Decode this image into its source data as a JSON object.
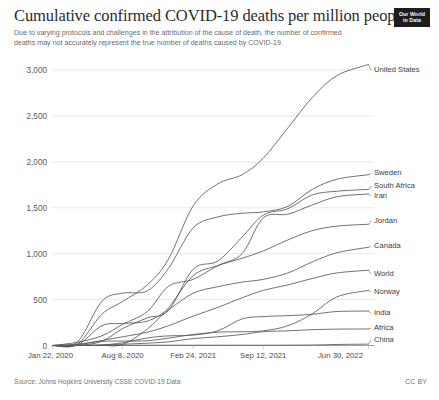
{
  "header": {
    "title": "Cumulative confirmed COVID-19 deaths per million people",
    "subtitle": "Due to varying protocols and challenges in the attribution of the cause of death, the number of confirmed deaths may not accurately represent the true number of deaths caused by COVID-19.",
    "logo_line1": "Our World",
    "logo_line2": "in Data"
  },
  "footer": {
    "source": "Source: Johns Hopkins University CSSE COVID-19 Data",
    "license": "CC BY"
  },
  "colors": {
    "line": "#575757",
    "grid": "#e0e0e0",
    "axis": "#888888",
    "text": "#3c3c3c",
    "logo_bg": "#1d1d1d"
  },
  "chart_data": {
    "type": "line",
    "title": "Cumulative confirmed COVID-19 deaths per million people",
    "subtitle": "Due to varying protocols and challenges in the attribution of the cause of death, the number of confirmed deaths may not accurately represent the true number of deaths caused by COVID-19.",
    "xlabel": "",
    "ylabel": "",
    "ylim": [
      0,
      3000
    ],
    "yticks": [
      0,
      500,
      1000,
      1500,
      2000,
      2500,
      3000
    ],
    "ytick_labels": [
      "0",
      "500",
      "1,000",
      "1,500",
      "2,000",
      "2,500",
      "3,000"
    ],
    "grid": true,
    "legend_position": "right-of-line-ends",
    "x_range": [
      "Jan 22, 2020",
      "Jun 30, 2022"
    ],
    "xticks": [
      "Jan 22, 2020",
      "Aug 8, 2020",
      "Feb 24, 2021",
      "Sep 12, 2021",
      "Jun 30, 2022"
    ],
    "xtick_fractions": [
      0.0,
      0.222,
      0.445,
      0.667,
      1.0
    ],
    "x": [
      "Jan 22, 2020",
      "Apr 1, 2020",
      "Jun 10, 2020",
      "Aug 8, 2020",
      "Oct 17, 2020",
      "Dec 16, 2020",
      "Feb 24, 2021",
      "May 5, 2021",
      "Jul 14, 2021",
      "Sep 12, 2021",
      "Nov 21, 2021",
      "Jan 30, 2022",
      "Apr 10, 2022",
      "Jun 30, 2022"
    ],
    "x_fractions": [
      0.0,
      0.078,
      0.156,
      0.222,
      0.3,
      0.367,
      0.445,
      0.523,
      0.6,
      0.667,
      0.745,
      0.822,
      0.9,
      1.0
    ],
    "series": [
      {
        "name": "United States",
        "label_value": 3060,
        "values": [
          0,
          12,
          340,
          480,
          660,
          940,
          1520,
          1760,
          1860,
          2040,
          2370,
          2700,
          2940,
          3060
        ]
      },
      {
        "name": "Sweden",
        "label_value": 1860,
        "values": [
          0,
          35,
          480,
          570,
          595,
          840,
          1280,
          1400,
          1440,
          1455,
          1515,
          1700,
          1810,
          1860
        ]
      },
      {
        "name": "South Africa",
        "label_value": 1700,
        "values": [
          0,
          1,
          45,
          185,
          300,
          380,
          830,
          920,
          1180,
          1420,
          1490,
          1640,
          1680,
          1700
        ]
      },
      {
        "name": "Iran",
        "label_value": 1650,
        "values": [
          0,
          35,
          105,
          230,
          370,
          645,
          720,
          870,
          1000,
          1390,
          1430,
          1530,
          1620,
          1650
        ]
      },
      {
        "name": "Jordan",
        "label_value": 1320,
        "values": [
          0,
          1,
          1,
          12,
          180,
          410,
          760,
          870,
          950,
          1030,
          1150,
          1250,
          1300,
          1320
        ]
      },
      {
        "name": "Canada",
        "label_value": 1070,
        "values": [
          0,
          6,
          215,
          240,
          265,
          390,
          570,
          640,
          690,
          720,
          790,
          910,
          1010,
          1070
        ]
      },
      {
        "name": "World",
        "label_value": 820,
        "values": [
          0,
          7,
          55,
          95,
          145,
          215,
          320,
          415,
          520,
          600,
          660,
          730,
          790,
          820
        ]
      },
      {
        "name": "Norway",
        "label_value": 600,
        "values": [
          0,
          15,
          45,
          48,
          52,
          80,
          120,
          145,
          150,
          160,
          215,
          345,
          530,
          600
        ]
      },
      {
        "name": "India",
        "label_value": 375,
        "values": [
          0,
          0,
          6,
          30,
          82,
          105,
          113,
          160,
          290,
          315,
          325,
          340,
          370,
          375
        ]
      },
      {
        "name": "Africa",
        "label_value": 180,
        "values": [
          0,
          0,
          4,
          14,
          25,
          40,
          75,
          95,
          120,
          150,
          160,
          172,
          178,
          180
        ]
      },
      {
        "name": "China",
        "label_value": 15,
        "values": [
          0,
          2,
          3,
          3,
          3,
          3,
          3,
          3,
          3,
          3,
          4,
          5,
          11,
          15
        ]
      }
    ],
    "label_y_positions": [
      70,
      173,
      186,
      196,
      221,
      246,
      274,
      292,
      313,
      328,
      340
    ]
  }
}
